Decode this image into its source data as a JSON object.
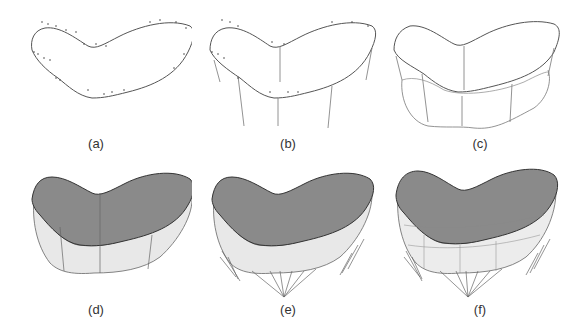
{
  "figure": {
    "panels": [
      {
        "id": "a",
        "label": "(a)",
        "stage": "point cloud with fitted top contour"
      },
      {
        "id": "b",
        "label": "(b)",
        "stage": "contour with vertical guide lines"
      },
      {
        "id": "c",
        "label": "(c)",
        "stage": "wireframe with bottom contour"
      },
      {
        "id": "d",
        "label": "(d)",
        "stage": "shaded top surface and side walls"
      },
      {
        "id": "e",
        "label": "(e)",
        "stage": "surface with support structures"
      },
      {
        "id": "f",
        "label": "(f)",
        "stage": "final meshed surface with supports"
      }
    ],
    "colors": {
      "top_surface": "#8a8a8a",
      "side_wall": "#e8e8e8",
      "line": "#555555",
      "point": "#444444"
    }
  }
}
